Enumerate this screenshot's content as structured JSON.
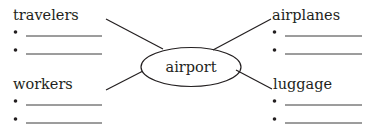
{
  "diagram": {
    "type": "word-web",
    "center": {
      "label": "airport"
    },
    "branches": [
      {
        "id": "travelers",
        "label": "travelers",
        "position": "top-left",
        "blanks": 2
      },
      {
        "id": "airplanes",
        "label": "airplanes",
        "position": "top-right",
        "blanks": 2
      },
      {
        "id": "workers",
        "label": "workers",
        "position": "bottom-left",
        "blanks": 2
      },
      {
        "id": "luggage",
        "label": "luggage",
        "position": "bottom-right",
        "blanks": 2
      }
    ]
  },
  "colors": {
    "ink": "#231f20",
    "background": "#ffffff"
  }
}
